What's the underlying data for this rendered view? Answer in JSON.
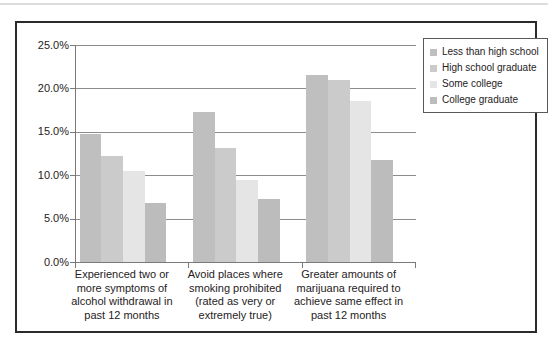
{
  "figure": {
    "background": "#ffffff",
    "frame_border_color": "#2b2b2b"
  },
  "chart_data": {
    "type": "bar",
    "title": "",
    "xlabel": "",
    "ylabel": "",
    "categories": [
      "Experienced two or more symptoms of alcohol withdrawal in past 12 months",
      "Avoid places where smoking prohibited (rated as very or extremely true)",
      "Greater amounts of marijuana required to achieve same effect in past 12 months"
    ],
    "series": [
      {
        "name": "Less than high school",
        "color": "#bfbfbf",
        "values": [
          14.8,
          17.3,
          21.5
        ]
      },
      {
        "name": "High school graduate",
        "color": "#cbcbcb",
        "values": [
          12.2,
          13.1,
          21.0
        ]
      },
      {
        "name": "Some college",
        "color": "#e5e5e5",
        "values": [
          10.5,
          9.5,
          18.6
        ]
      },
      {
        "name": "College graduate",
        "color": "#bcbcbc",
        "values": [
          6.8,
          7.3,
          11.8
        ]
      }
    ],
    "ylim": [
      0,
      25
    ],
    "ytick_step": 5,
    "ytick_labels_top_to_bottom": [
      "25.0%",
      "20.0%",
      "15.0%",
      "10.0%",
      "5.0%",
      "0.0%"
    ],
    "grid": true,
    "gridline_color": "#8c8c8c",
    "axis_color": "#7a7a7a",
    "legend_position": "top-right"
  }
}
